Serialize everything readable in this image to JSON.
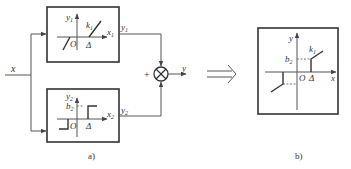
{
  "diagram_a": {
    "caption": "a)",
    "input_label": "x",
    "sum_sign": "+",
    "output_label": "y",
    "top_block": {
      "y_axis": "y",
      "y_sub": "1",
      "x_axis": "x",
      "x_sub": "1",
      "slope_label": "k",
      "slope_sub": "1",
      "origin": "O",
      "threshold": "Δ",
      "out_label": "y",
      "out_sub": "1"
    },
    "bottom_block": {
      "y_axis": "y",
      "y_sub": "2",
      "x_axis": "x",
      "x_sub": "2",
      "level_label": "b",
      "level_sub": "2",
      "origin": "O",
      "threshold": "Δ",
      "out_label": "y",
      "out_sub": "2"
    }
  },
  "equivalence_arrow": "⟹",
  "diagram_b": {
    "caption": "b)",
    "y_axis": "y",
    "x_axis": "x",
    "slope_label": "k",
    "slope_sub": "1",
    "level_label": "b",
    "level_sub": "2",
    "origin": "O",
    "threshold": "Δ"
  }
}
